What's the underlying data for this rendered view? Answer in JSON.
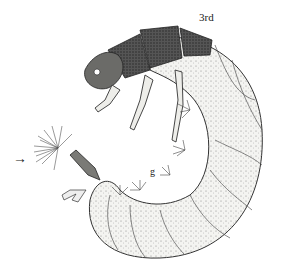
{
  "figure": {
    "labels": {
      "segment": "3rd",
      "gill": "g"
    },
    "arrow": "→",
    "colors": {
      "ink": "#222222",
      "background": "#ffffff",
      "body": "#f1f1ee"
    }
  }
}
